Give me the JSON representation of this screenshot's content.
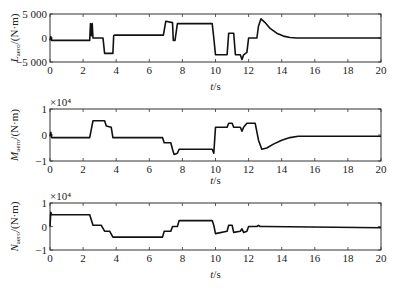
{
  "chart_data": [
    {
      "type": "line",
      "title": "",
      "xlabel": "t/s",
      "ylabel": "L_aero/(N·m)",
      "ylabel_main": "L",
      "ylabel_sub": "aero",
      "ylabel_unit": "/(N·m)",
      "xlim": [
        0,
        20
      ],
      "ylim": [
        -5000,
        5000
      ],
      "xticks": [
        "0",
        "2",
        "4",
        "6",
        "8",
        "10",
        "12",
        "14",
        "16",
        "18",
        "20"
      ],
      "yticks": [
        "5 000",
        "0",
        "−5 000"
      ],
      "ytick_values": [
        5000,
        0,
        -5000
      ],
      "multiplier": "",
      "grid": false,
      "series": [
        {
          "name": "L_aero",
          "x": [
            0,
            0.05,
            0.1,
            2.4,
            2.45,
            2.5,
            2.55,
            2.6,
            3.2,
            3.3,
            3.8,
            3.85,
            3.9,
            6.85,
            7.0,
            7.4,
            7.45,
            7.55,
            7.7,
            7.8,
            9.8,
            9.9,
            10.0,
            10.1,
            10.7,
            10.8,
            11.1,
            11.2,
            11.5,
            11.6,
            11.7,
            11.9,
            12.0,
            12.5,
            12.6,
            12.75,
            13.0,
            13.3,
            13.7,
            14.1,
            14.5,
            14.9,
            20
          ],
          "y": [
            -500,
            300,
            -500,
            -500,
            3000,
            500,
            3000,
            0,
            0,
            -3200,
            -3200,
            500,
            600,
            600,
            3500,
            3200,
            -500,
            -500,
            3000,
            3000,
            3000,
            0,
            -3500,
            -3500,
            -3500,
            1000,
            1000,
            -3500,
            -3500,
            -4500,
            -3500,
            -3000,
            0,
            0,
            2500,
            4000,
            3200,
            2000,
            1000,
            400,
            100,
            0,
            0
          ]
        }
      ]
    },
    {
      "type": "line",
      "title": "",
      "xlabel": "t/s",
      "ylabel": "M_aero/(N·m)",
      "ylabel_main": "M",
      "ylabel_sub": "aero",
      "ylabel_unit": "/(N·m)",
      "xlim": [
        0,
        20
      ],
      "ylim": [
        -1,
        1
      ],
      "xticks": [
        "0",
        "2",
        "4",
        "6",
        "8",
        "10",
        "12",
        "14",
        "16",
        "18",
        "20"
      ],
      "yticks": [
        "1",
        "0",
        "−1"
      ],
      "ytick_values": [
        1,
        0,
        -1
      ],
      "multiplier": "×10⁴",
      "grid": false,
      "series": [
        {
          "name": "M_aero",
          "x": [
            0,
            0.05,
            0.1,
            2.4,
            2.6,
            3.3,
            3.4,
            3.7,
            3.8,
            3.85,
            6.8,
            6.9,
            7.3,
            7.4,
            7.5,
            7.7,
            7.8,
            9.8,
            9.9,
            10.0,
            10.1,
            10.7,
            10.8,
            11.0,
            11.1,
            11.5,
            11.6,
            11.7,
            11.9,
            12.0,
            12.4,
            12.6,
            12.8,
            13.1,
            13.5,
            14.0,
            14.5,
            15.0,
            20
          ],
          "y": [
            -0.05,
            0.1,
            -0.1,
            -0.1,
            0.55,
            0.55,
            0.35,
            0.3,
            -0.1,
            -0.1,
            -0.1,
            -0.3,
            -0.3,
            -0.55,
            -0.75,
            -0.7,
            -0.55,
            -0.55,
            -0.7,
            0.3,
            0.3,
            0.3,
            0.45,
            0.45,
            0.3,
            0.3,
            0.15,
            0.3,
            0.45,
            0.45,
            0.45,
            -0.2,
            -0.55,
            -0.5,
            -0.35,
            -0.2,
            -0.1,
            -0.05,
            -0.05
          ]
        }
      ]
    },
    {
      "type": "line",
      "title": "",
      "xlabel": "t/s",
      "ylabel": "N_aero/(N·m)",
      "ylabel_main": "N",
      "ylabel_sub": "aero",
      "ylabel_unit": "/(N·m)",
      "xlim": [
        0,
        20
      ],
      "ylim": [
        -1,
        1
      ],
      "xticks": [
        "0",
        "2",
        "4",
        "6",
        "8",
        "10",
        "12",
        "14",
        "16",
        "18",
        "20"
      ],
      "yticks": [
        "1",
        "0",
        "−1"
      ],
      "ytick_values": [
        1,
        0,
        -1
      ],
      "multiplier": "×10⁴",
      "grid": false,
      "series": [
        {
          "name": "N_aero",
          "x": [
            0,
            0.05,
            0.1,
            0.2,
            2.4,
            2.6,
            3.1,
            3.3,
            3.6,
            3.8,
            6.8,
            6.9,
            7.3,
            7.4,
            7.7,
            7.8,
            9.8,
            9.9,
            10.0,
            10.7,
            10.8,
            11.0,
            11.1,
            11.5,
            11.6,
            11.7,
            11.9,
            12.0,
            12.5,
            12.6,
            12.7,
            13.0,
            20
          ],
          "y": [
            0,
            0.6,
            0.5,
            0.5,
            0.5,
            0.05,
            0.05,
            -0.2,
            -0.2,
            -0.45,
            -0.45,
            -0.2,
            -0.2,
            0.0,
            0.0,
            0.25,
            0.25,
            0.05,
            -0.3,
            -0.2,
            0.05,
            0.05,
            -0.25,
            -0.2,
            -0.1,
            -0.25,
            -0.2,
            0.0,
            0.0,
            0.05,
            0.0,
            0.0,
            -0.05
          ]
        }
      ]
    }
  ]
}
